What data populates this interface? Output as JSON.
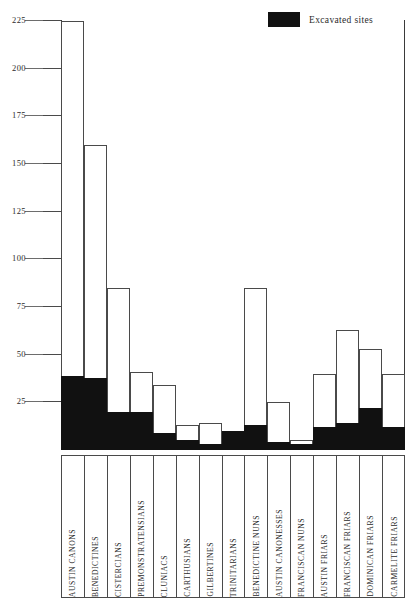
{
  "legend": {
    "swatch_name": "excavated-sites-swatch",
    "label": "Excavated sites",
    "color": "#111111"
  },
  "axis": {
    "y_ticks": [
      "225",
      "200",
      "175",
      "150",
      "125",
      "100",
      "75",
      "50",
      "25"
    ]
  },
  "chart_data": {
    "type": "bar",
    "title": "",
    "subtitle": "",
    "xlabel": "",
    "ylabel": "",
    "ylim": [
      0,
      225
    ],
    "yticks": [
      25,
      50,
      75,
      100,
      125,
      150,
      175,
      200,
      225
    ],
    "grid": false,
    "legend_position": "top-right",
    "stacked": true,
    "categories": [
      "AUSTIN CANONS",
      "BENEDICTINES",
      "CISTERCIANS",
      "PREMONSTRATENSIANS",
      "CLUNIACS",
      "CARTHUSIANS",
      "GILBERTINES",
      "TRINITARIANS",
      "BENEDICTINE NUNS",
      "AUSTIN CANONESSES",
      "FRANCISCAN NUNS",
      "AUSTIN FRIARS",
      "FRANCISCAN FRIARS",
      "DOMINICAN FRIARS",
      "CARMELITE FRIARS"
    ],
    "series": [
      {
        "name": "Total sites",
        "values": [
          225,
          160,
          85,
          41,
          34,
          13,
          14,
          5,
          85,
          25,
          5,
          40,
          63,
          53,
          40
        ]
      },
      {
        "name": "Excavated sites",
        "values": [
          39,
          38,
          20,
          20,
          9,
          5,
          3,
          10,
          13,
          4,
          3,
          12,
          14,
          22,
          12
        ]
      }
    ]
  }
}
